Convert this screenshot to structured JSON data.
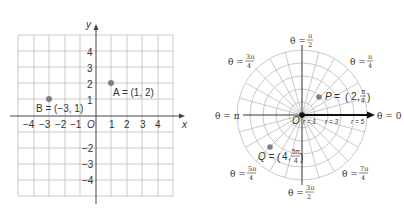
{
  "cartesian": {
    "x_axis_label": "x",
    "y_axis_label": "y",
    "origin_label": "O",
    "x_ticks": [
      "−4",
      "−3",
      "−2",
      "−1",
      "1",
      "2",
      "3",
      "4"
    ],
    "y_ticks_pos": [
      "1",
      "2",
      "3",
      "4"
    ],
    "y_ticks_neg": [
      "−2",
      "−3",
      "−4"
    ],
    "points": [
      {
        "name": "A",
        "label": "A = (1, 2)",
        "x": 1,
        "y": 2
      },
      {
        "name": "B",
        "label": "B = (−3, 1)",
        "x": -3,
        "y": 1
      }
    ],
    "grid_color": "#bbbbbb",
    "point_color": "#808080"
  },
  "polar": {
    "origin_label": "O",
    "angle_labels": {
      "a0": "θ = 0",
      "api": "θ = π",
      "api2_left": "θ =",
      "api2_num": "π",
      "api2_den": "2",
      "a3pi2_left": "θ =",
      "a3pi2_num": "3π",
      "a3pi2_den": "2",
      "api4_left": "θ =",
      "api4_num": "π",
      "api4_den": "4",
      "a3pi4_left": "θ =",
      "a3pi4_num": "3π",
      "a3pi4_den": "4",
      "a5pi4_left": "θ =",
      "a5pi4_num": "5π",
      "a5pi4_den": "4",
      "a7pi4_left": "θ =",
      "a7pi4_num": "7π",
      "a7pi4_den": "4"
    },
    "radius_labels": [
      "r = 1",
      "r = 3",
      "r = 5"
    ],
    "points": [
      {
        "name": "P",
        "prefix": "P =",
        "r": "2",
        "theta_num": "π",
        "theta_den": "4"
      },
      {
        "name": "Q",
        "prefix": "Q =",
        "r": "4",
        "theta_num": "5π",
        "theta_den": "4"
      }
    ]
  }
}
